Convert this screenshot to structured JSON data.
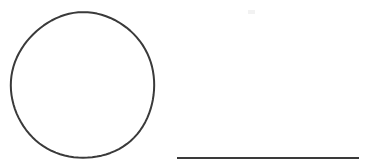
{
  "canvas": {
    "width": 378,
    "height": 167,
    "background_color": "#ffffff",
    "title": "Freehand sketch: circle and horizontal line"
  },
  "palette": {
    "stroke_color": "#3a3a3a",
    "stroke_color_soft": "#4a4a4a",
    "artifact_color": "#f2f2f2",
    "background_color": "#ffffff"
  },
  "shapes": [
    {
      "id": "circle",
      "kind": "ellipse",
      "label": "Circle",
      "center_x": 83,
      "center_y": 85.5,
      "radius_x": 71.5,
      "radius_y": 73,
      "bounds": {
        "x": 11.5,
        "y": 12.5,
        "width": 143,
        "height": 146
      },
      "stroke_width": 2,
      "stroke_color": "#3a3a3a",
      "fill": "none"
    },
    {
      "id": "line",
      "kind": "line",
      "label": "Horizontal line",
      "x1": 177,
      "y1": 158,
      "x2": 359,
      "y2": 158,
      "length": 182,
      "stroke_width": 2.2,
      "stroke_color": "#3a3a3a",
      "fill": "none"
    },
    {
      "id": "artifact",
      "kind": "speck",
      "label": "Faint mark",
      "x": 248,
      "y": 10,
      "width": 7,
      "height": 4,
      "stroke_color": "#f2f2f2"
    }
  ]
}
